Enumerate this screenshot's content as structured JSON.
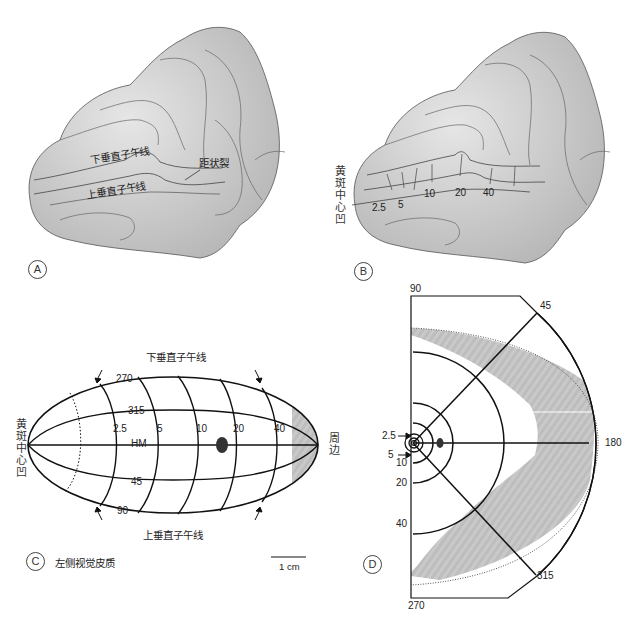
{
  "panels": {
    "A": {
      "label": "A",
      "annotations": {
        "lower_vertical_meridian": "下垂直子午线",
        "upper_vertical_meridian": "上垂直子午线",
        "calcarine_fissure": "距状裂"
      }
    },
    "B": {
      "label": "B",
      "fovea_label": "黄斑中心凹",
      "eccentricity_labels": [
        "2.5",
        "5",
        "10",
        "20",
        "40"
      ]
    },
    "C": {
      "label": "C",
      "caption": "左侧视觉皮质",
      "top_title": "下垂直子午线",
      "bottom_title": "上垂直子午线",
      "left_label": "黄斑中心凹",
      "right_label": "周边",
      "eccentricity_labels": [
        "2.5",
        "5",
        "10",
        "20",
        "40"
      ],
      "meridian_labels": {
        "top": "270",
        "upper": "315",
        "middle": "HM",
        "lower": "45",
        "bottom": "90"
      },
      "scale_bar": "1 cm"
    },
    "D": {
      "label": "D",
      "angle_labels": {
        "top": "90",
        "upper_diag": "45",
        "right": "180",
        "lower_diag": "315",
        "bottom": "270"
      },
      "eccentricity_labels": [
        "2.5",
        "5",
        "10",
        "20",
        "40"
      ]
    }
  },
  "colors": {
    "shading": "#b9b9b9",
    "line": "#111111",
    "brain_fill": "#d6d6d6",
    "blind_spot": "#333333"
  }
}
